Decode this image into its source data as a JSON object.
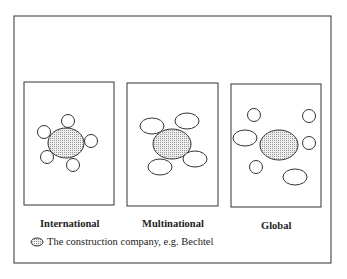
{
  "panels": [
    {
      "label": "International"
    },
    {
      "label": "Multinational"
    },
    {
      "label": "Global"
    }
  ],
  "legend": {
    "text": "The construction company, e.g. Bechtel"
  },
  "colors": {
    "stroke": "#333333",
    "fill_dots": "#aaaaaa"
  }
}
